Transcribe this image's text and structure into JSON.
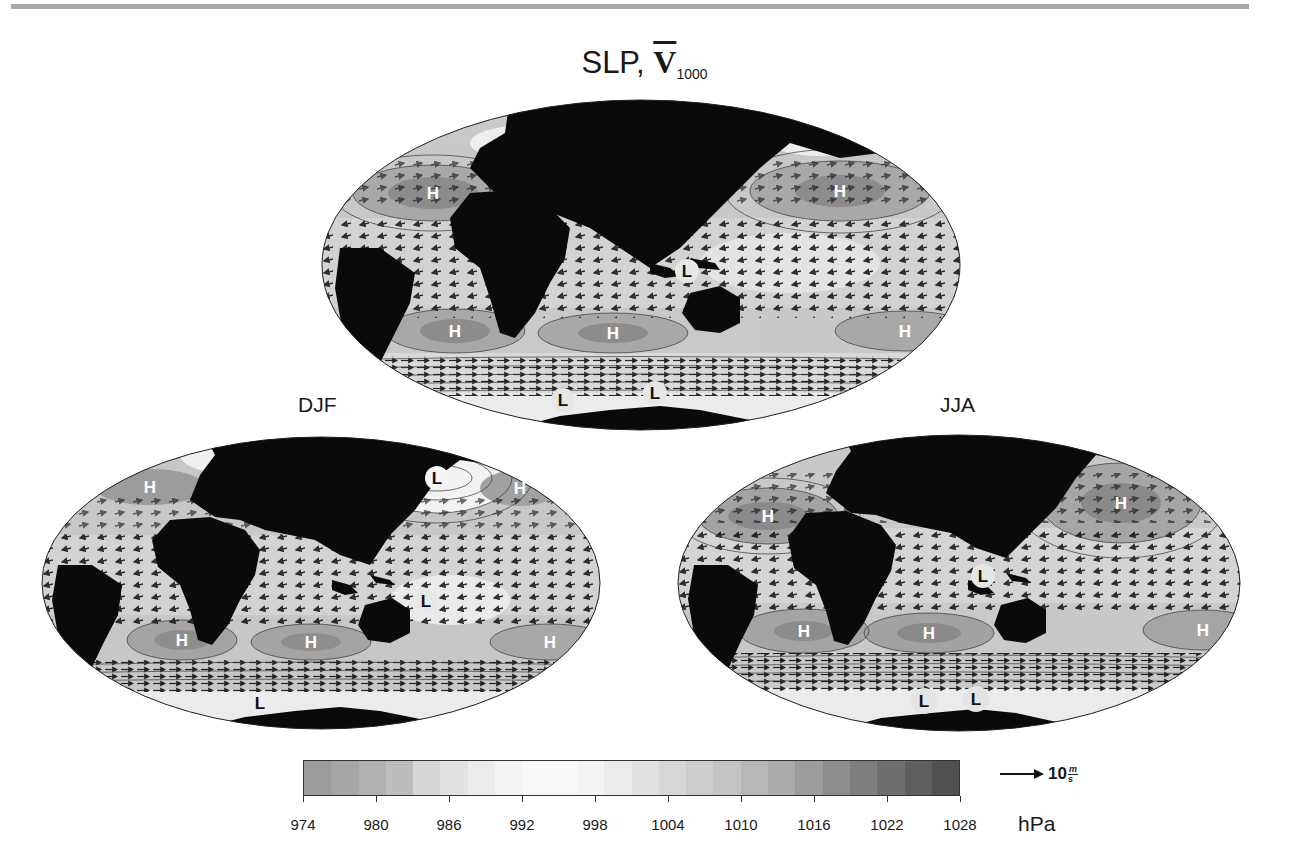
{
  "figure": {
    "title_prefix": "SLP, ",
    "title_vector": "V",
    "title_subscript": "1000",
    "panels": [
      {
        "id": "annual",
        "label": "",
        "highs": [
          {
            "label": "H",
            "x": 113,
            "y": 95
          },
          {
            "label": "H",
            "x": 520,
            "y": 93
          },
          {
            "label": "H",
            "x": 135,
            "y": 233
          },
          {
            "label": "H",
            "x": 293,
            "y": 235
          },
          {
            "label": "H",
            "x": 585,
            "y": 233
          }
        ],
        "lows": [
          {
            "label": "L",
            "x": 367,
            "y": 173
          },
          {
            "label": "L",
            "x": 243,
            "y": 302
          },
          {
            "label": "L",
            "x": 335,
            "y": 295
          }
        ]
      },
      {
        "id": "djf",
        "label": "DJF",
        "highs": [
          {
            "label": "H",
            "x": 110,
            "y": 52
          },
          {
            "label": "H",
            "x": 480,
            "y": 53
          },
          {
            "label": "H",
            "x": 142,
            "y": 205
          },
          {
            "label": "H",
            "x": 271,
            "y": 207
          },
          {
            "label": "H",
            "x": 510,
            "y": 207
          }
        ],
        "lows": [
          {
            "label": "L",
            "x": 397,
            "y": 43
          },
          {
            "label": "L",
            "x": 386,
            "y": 166
          },
          {
            "label": "L",
            "x": 220,
            "y": 268
          }
        ]
      },
      {
        "id": "jja",
        "label": "JJA",
        "highs": [
          {
            "label": "H",
            "x": 92,
            "y": 83
          },
          {
            "label": "H",
            "x": 445,
            "y": 70
          },
          {
            "label": "H",
            "x": 128,
            "y": 198
          },
          {
            "label": "H",
            "x": 253,
            "y": 200
          },
          {
            "label": "H",
            "x": 527,
            "y": 197
          }
        ],
        "lows": [
          {
            "label": "L",
            "x": 307,
            "y": 143
          },
          {
            "label": "L",
            "x": 248,
            "y": 265
          },
          {
            "label": "L",
            "x": 300,
            "y": 262
          }
        ]
      }
    ]
  },
  "colorbar": {
    "unit": "hPa",
    "ticks": [
      "974",
      "980",
      "986",
      "992",
      "998",
      "1004",
      "1010",
      "1016",
      "1022",
      "1028"
    ],
    "range": [
      974,
      1028
    ],
    "colors": [
      "#9c9c9c",
      "#a6a6a6",
      "#b1b1b1",
      "#bcbcbc",
      "#d6d6d6",
      "#e2e2e2",
      "#ececec",
      "#f3f3f3",
      "#f8f8f8",
      "#f8f8f8",
      "#f3f3f3",
      "#ebebeb",
      "#e1e1e1",
      "#d7d7d7",
      "#cdcdcd",
      "#c3c3c3",
      "#b7b7b7",
      "#aaaaaa",
      "#9c9c9c",
      "#8d8d8d",
      "#7e7e7e",
      "#6f6f6f",
      "#5f5f5f",
      "#505050"
    ]
  },
  "vector_legend": {
    "value": "10",
    "unit_numerator": "m",
    "unit_denominator": "s"
  },
  "colors": {
    "land": "#0a0a0a",
    "ocean_mid": "#c6c6c6",
    "high_fill": "#8a8a8a",
    "low_fill": "#f0f0f0",
    "rule": "#a9a9a9"
  }
}
